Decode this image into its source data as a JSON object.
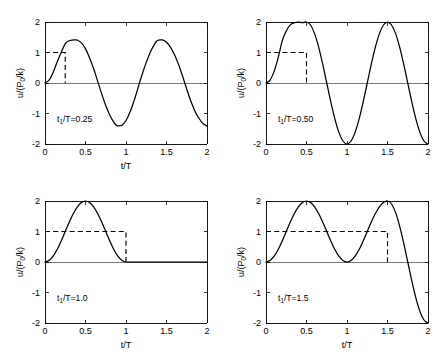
{
  "figure": {
    "background_color": "#ffffff",
    "line_color": "#000000",
    "panel_count": 4
  },
  "axes": {
    "x_label": "t/T",
    "y_label_main": "u/(P",
    "y_label_sub": "0",
    "y_label_tail": "/k)",
    "x_ticks": [
      "0",
      "0.5",
      "1",
      "1.5",
      "2"
    ],
    "x_tick_values": [
      0,
      0.5,
      1,
      1.5,
      2
    ],
    "y_ticks": [
      "2",
      "1",
      "0",
      "-1",
      "-2"
    ],
    "y_tick_values": [
      2,
      1,
      0,
      -1,
      -2
    ],
    "xlim": [
      0,
      2
    ],
    "ylim": [
      -2,
      2
    ]
  },
  "chart_data": [
    {
      "id": "panel-1",
      "type": "line",
      "title": "",
      "annotation": "t₁/T=0.25",
      "annotation_prefix": "t",
      "annotation_sub": "1",
      "annotation_suffix": "/T=0.25",
      "xlabel": "t/T",
      "ylabel": "u/(P0/k)",
      "show_xlabel": true,
      "xlim": [
        0,
        2
      ],
      "ylim": [
        -2,
        2
      ],
      "grid": false,
      "legend": "none",
      "td_over_T": 0.25,
      "peak_value": 1.414,
      "series": [
        {
          "name": "response",
          "style": "solid",
          "description": "Undamped SDOF response to rectangular pulse of duration t1/T=0.25; rises from 0, peaks ~1.41 near t/T=0.37, oscillates with amplitude 1.41 thereafter",
          "x": [
            0,
            0.05,
            0.1,
            0.15,
            0.2,
            0.25,
            0.3,
            0.35,
            0.375,
            0.4,
            0.45,
            0.5,
            0.55,
            0.6,
            0.625,
            0.65,
            0.7,
            0.75,
            0.8,
            0.85,
            0.875,
            0.9,
            0.95,
            1.0,
            1.05,
            1.1,
            1.125,
            1.15,
            1.2,
            1.25,
            1.3,
            1.35,
            1.375,
            1.4,
            1.45,
            1.5,
            1.55,
            1.6,
            1.625,
            1.65,
            1.7,
            1.75,
            1.8,
            1.85,
            1.875,
            1.9,
            1.95,
            2.0
          ],
          "y": [
            0,
            0.095,
            0.345,
            0.691,
            1.0,
            1.293,
            1.386,
            1.411,
            1.414,
            1.405,
            1.314,
            1.118,
            0.831,
            0.475,
            0.271,
            0.063,
            -0.357,
            -0.739,
            -1.057,
            -1.291,
            -1.372,
            -1.405,
            -1.382,
            -1.229,
            -0.954,
            -0.579,
            -0.363,
            -0.142,
            0.287,
            0.677,
            1.011,
            1.267,
            1.362,
            1.407,
            1.411,
            1.336,
            1.169,
            0.918,
            0.764,
            0.599,
            0.211,
            -0.203,
            -0.593,
            -0.915,
            -1.046,
            -1.154,
            -1.328,
            -1.411
          ]
        },
        {
          "name": "load-pulse",
          "style": "dashed",
          "description": "Rectangular load pulse amplitude 1 from t/T=0 to t/T=0.25",
          "x": [
            0,
            0.25,
            0.25
          ],
          "y": [
            1,
            1,
            0
          ]
        }
      ]
    },
    {
      "id": "panel-2",
      "type": "line",
      "title": "",
      "annotation": "t₁/T=0.50",
      "annotation_prefix": "t",
      "annotation_sub": "1",
      "annotation_suffix": "/T=0.50",
      "xlabel": "",
      "ylabel": "u/(P0/k)",
      "show_xlabel": false,
      "xlim": [
        0,
        2
      ],
      "ylim": [
        -2,
        2
      ],
      "grid": false,
      "legend": "none",
      "td_over_T": 0.5,
      "peak_value": 2.0,
      "series": [
        {
          "name": "response",
          "style": "solid",
          "description": "Response to rectangular pulse t1/T=0.5; reaches 2 at t/T=0.5, then free vibration of amplitude 2 with minima -2 at t/T=1 and 2",
          "x": [
            0,
            0.05,
            0.1,
            0.15,
            0.2,
            0.25,
            0.3,
            0.35,
            0.4,
            0.45,
            0.5,
            0.55,
            0.6,
            0.65,
            0.7,
            0.75,
            0.8,
            0.85,
            0.9,
            0.95,
            1.0,
            1.05,
            1.1,
            1.15,
            1.2,
            1.25,
            1.3,
            1.35,
            1.4,
            1.45,
            1.5,
            1.55,
            1.6,
            1.65,
            1.7,
            1.75,
            1.8,
            1.85,
            1.9,
            1.95,
            2.0
          ],
          "y": [
            0,
            0.095,
            0.382,
            0.824,
            1.382,
            1.707,
            1.905,
            1.976,
            2.0,
            1.976,
            2.0,
            1.902,
            1.618,
            1.176,
            0.618,
            0.0,
            -0.618,
            -1.176,
            -1.618,
            -1.902,
            -2.0,
            -1.902,
            -1.618,
            -1.176,
            -0.618,
            0.0,
            0.618,
            1.176,
            1.618,
            1.902,
            2.0,
            1.902,
            1.618,
            1.176,
            0.618,
            0.0,
            -0.618,
            -1.176,
            -1.618,
            -1.902,
            -2.0
          ]
        },
        {
          "name": "load-pulse",
          "style": "dashed",
          "description": "Rectangular load pulse amplitude 1 from t/T=0 to t/T=0.5",
          "x": [
            0,
            0.5,
            0.5
          ],
          "y": [
            1,
            1,
            0
          ]
        }
      ]
    },
    {
      "id": "panel-3",
      "type": "line",
      "title": "",
      "annotation": "t₁/T=1.0",
      "annotation_prefix": "t",
      "annotation_sub": "1",
      "annotation_suffix": "/T=1.0",
      "xlabel": "t/T",
      "ylabel": "u/(P0/k)",
      "show_xlabel": true,
      "xlim": [
        0,
        2
      ],
      "ylim": [
        -2,
        2
      ],
      "grid": false,
      "legend": "none",
      "td_over_T": 1.0,
      "peak_value": 2.0,
      "series": [
        {
          "name": "response",
          "style": "solid",
          "description": "Response to rectangular pulse t1/T=1.0; single hump peaking at 2 at t/T=0.5, returns to 0 at t/T=1 and stays at 0 (zero residual vibration)",
          "x": [
            0,
            0.05,
            0.1,
            0.15,
            0.2,
            0.25,
            0.3,
            0.35,
            0.4,
            0.45,
            0.5,
            0.55,
            0.6,
            0.65,
            0.7,
            0.75,
            0.8,
            0.85,
            0.9,
            0.95,
            1.0,
            1.1,
            1.2,
            1.3,
            1.4,
            1.5,
            1.6,
            1.7,
            1.8,
            1.9,
            2.0
          ],
          "y": [
            0,
            0.049,
            0.191,
            0.412,
            0.691,
            1.0,
            1.309,
            1.588,
            1.809,
            1.951,
            2.0,
            1.951,
            1.809,
            1.588,
            1.309,
            1.0,
            0.691,
            0.412,
            0.191,
            0.049,
            0,
            0,
            0,
            0,
            0,
            0,
            0,
            0,
            0,
            0,
            0
          ]
        },
        {
          "name": "load-pulse",
          "style": "dashed",
          "description": "Rectangular load pulse amplitude 1 from t/T=0 to t/T=1.0",
          "x": [
            0,
            1.0,
            1.0
          ],
          "y": [
            1,
            1,
            0
          ]
        }
      ]
    },
    {
      "id": "panel-4",
      "type": "line",
      "title": "",
      "annotation": "t₁/T=1.5",
      "annotation_prefix": "t",
      "annotation_sub": "1",
      "annotation_suffix": "/T=1.5",
      "xlabel": "t/T",
      "ylabel": "u/(P0/k)",
      "show_xlabel": true,
      "xlim": [
        0,
        2
      ],
      "ylim": [
        -2,
        2
      ],
      "grid": false,
      "legend": "none",
      "td_over_T": 1.5,
      "peak_value": 2.0,
      "series": [
        {
          "name": "response",
          "style": "solid",
          "description": "Response to rectangular pulse t1/T=1.5; two humps peaking at 2 (t/T=0.5 and 1.5), touching 0 at t/T=1, then free vibration reaching -2 at t/T=2",
          "x": [
            0,
            0.05,
            0.1,
            0.15,
            0.2,
            0.25,
            0.3,
            0.35,
            0.4,
            0.45,
            0.5,
            0.55,
            0.6,
            0.65,
            0.7,
            0.75,
            0.8,
            0.85,
            0.9,
            0.95,
            1.0,
            1.05,
            1.1,
            1.15,
            1.2,
            1.25,
            1.3,
            1.35,
            1.4,
            1.45,
            1.5,
            1.55,
            1.6,
            1.65,
            1.7,
            1.75,
            1.8,
            1.85,
            1.9,
            1.95,
            2.0
          ],
          "y": [
            0,
            0.049,
            0.191,
            0.412,
            0.691,
            1.0,
            1.309,
            1.588,
            1.809,
            1.951,
            2.0,
            1.951,
            1.809,
            1.588,
            1.309,
            1.0,
            0.691,
            0.412,
            0.191,
            0.049,
            0,
            0.049,
            0.191,
            0.412,
            0.691,
            1.0,
            1.309,
            1.588,
            1.809,
            1.951,
            2.0,
            1.902,
            1.618,
            1.176,
            0.618,
            0.0,
            -0.618,
            -1.176,
            -1.618,
            -1.902,
            -2.0
          ]
        },
        {
          "name": "load-pulse",
          "style": "dashed",
          "description": "Rectangular load pulse amplitude 1 from t/T=0 to t/T=1.5",
          "x": [
            0,
            1.5,
            1.5
          ],
          "y": [
            1,
            1,
            0
          ]
        }
      ]
    }
  ]
}
